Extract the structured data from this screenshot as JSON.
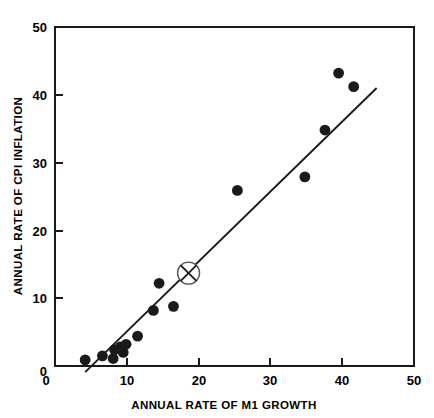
{
  "chart_data": {
    "type": "scatter",
    "title": "",
    "xlabel": "ANNUAL RATE OF M1 GROWTH",
    "ylabel": "ANNUAL RATE OF CPI INFLATION",
    "xlim": [
      0,
      50
    ],
    "ylim": [
      0,
      50
    ],
    "xticks": [
      0,
      10,
      20,
      30,
      40,
      50
    ],
    "yticks": [
      0,
      10,
      20,
      30,
      40,
      50
    ],
    "xtick_labels": [
      "0",
      "10",
      "20",
      "30",
      "40",
      "50"
    ],
    "ytick_labels": [
      "0",
      "10",
      "20",
      "30",
      "40",
      "50"
    ],
    "grid": false,
    "legend": false,
    "series": [
      {
        "name": "countries",
        "marker": "filled-circle",
        "color": "#1a1a1a",
        "points": [
          {
            "x": 4.2,
            "y": 0.9
          },
          {
            "x": 6.6,
            "y": 1.5
          },
          {
            "x": 8.1,
            "y": 1.1
          },
          {
            "x": 8.3,
            "y": 2.4
          },
          {
            "x": 9.1,
            "y": 2.8
          },
          {
            "x": 9.5,
            "y": 2.0
          },
          {
            "x": 9.9,
            "y": 3.2
          },
          {
            "x": 11.5,
            "y": 4.4
          },
          {
            "x": 13.7,
            "y": 8.2
          },
          {
            "x": 14.5,
            "y": 12.2
          },
          {
            "x": 16.5,
            "y": 8.8
          },
          {
            "x": 25.4,
            "y": 25.9
          },
          {
            "x": 34.8,
            "y": 27.9
          },
          {
            "x": 37.6,
            "y": 34.8
          },
          {
            "x": 39.5,
            "y": 43.2
          },
          {
            "x": 41.6,
            "y": 41.2
          }
        ]
      },
      {
        "name": "highlighted-observation",
        "marker": "circled-x",
        "color": "#1a1a1a",
        "points": [
          {
            "x": 18.6,
            "y": 13.7
          }
        ]
      }
    ],
    "fit_line": {
      "name": "regression-line",
      "color": "#1a1a1a",
      "x_start": 4.2,
      "y_start": -0.9,
      "x_end": 44.8,
      "y_end": 41.0
    }
  },
  "axes": {
    "x_title": "ANNUAL RATE OF M1 GROWTH",
    "y_title": "ANNUAL RATE OF CPI INFLATION",
    "x_tick_labels": [
      "0",
      "10",
      "20",
      "30",
      "40",
      "50"
    ],
    "y_tick_labels": [
      "0",
      "10",
      "20",
      "30",
      "40",
      "50"
    ]
  }
}
